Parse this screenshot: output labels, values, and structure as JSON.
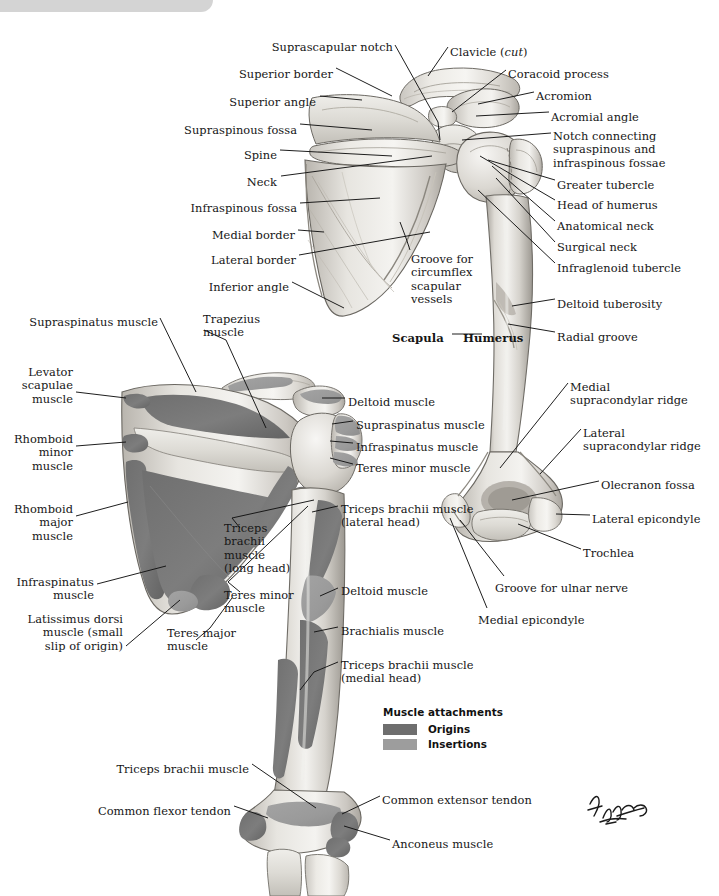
{
  "header": {
    "text": "SEE ALSO PLATE 400"
  },
  "plate": {
    "title": "Muscles of Shoulder and Arm: Bone and Muscle Attachments (Posterior View)"
  },
  "legend": {
    "title": "Muscle attachments",
    "items": [
      {
        "label": "Origins",
        "color": "#6e6e6e"
      },
      {
        "label": "Insertions",
        "color": "#9d9d9d"
      }
    ]
  },
  "bone_labels": [
    {
      "id": "suprascapular-notch",
      "text": "Suprascapular notch",
      "x": 393,
      "y": 41,
      "align": "right"
    },
    {
      "id": "clavicle-cut",
      "text": "Clavicle (cut)",
      "x": 450,
      "y": 46,
      "align": "left",
      "italic_part": "cut"
    },
    {
      "id": "superior-border",
      "text": "Superior border",
      "x": 333,
      "y": 68,
      "align": "right"
    },
    {
      "id": "coracoid-process",
      "text": "Coracoid process",
      "x": 508,
      "y": 68,
      "align": "left"
    },
    {
      "id": "superior-angle",
      "text": "Superior angle",
      "x": 316,
      "y": 96,
      "align": "right"
    },
    {
      "id": "acromion",
      "text": "Acromion",
      "x": 536,
      "y": 90,
      "align": "left"
    },
    {
      "id": "acromial-angle",
      "text": "Acromial angle",
      "x": 551,
      "y": 111,
      "align": "left"
    },
    {
      "id": "supraspinous-fossa",
      "text": "Supraspinous fossa",
      "x": 297,
      "y": 124,
      "align": "right"
    },
    {
      "id": "notch-connecting",
      "text": "Notch connecting\nsupraspinous and\ninfraspinous fossae",
      "x": 553,
      "y": 130,
      "align": "left"
    },
    {
      "id": "spine",
      "text": "Spine",
      "x": 277,
      "y": 149,
      "align": "right"
    },
    {
      "id": "greater-tubercle",
      "text": "Greater tubercle",
      "x": 557,
      "y": 179,
      "align": "left"
    },
    {
      "id": "neck",
      "text": "Neck",
      "x": 277,
      "y": 176,
      "align": "right"
    },
    {
      "id": "head-of-humerus",
      "text": "Head of humerus",
      "x": 557,
      "y": 199,
      "align": "left"
    },
    {
      "id": "infraspinous-fossa",
      "text": "Infraspinous fossa",
      "x": 297,
      "y": 202,
      "align": "right"
    },
    {
      "id": "anatomical-neck",
      "text": "Anatomical neck",
      "x": 557,
      "y": 220,
      "align": "left"
    },
    {
      "id": "medial-border",
      "text": "Medial border",
      "x": 295,
      "y": 229,
      "align": "right"
    },
    {
      "id": "surgical-neck",
      "text": "Surgical neck",
      "x": 557,
      "y": 241,
      "align": "left"
    },
    {
      "id": "lateral-border",
      "text": "Lateral border",
      "x": 296,
      "y": 254,
      "align": "right"
    },
    {
      "id": "infraglenoid-tubercle",
      "text": "Infraglenoid tubercle",
      "x": 557,
      "y": 262,
      "align": "left"
    },
    {
      "id": "inferior-angle",
      "text": "Inferior angle",
      "x": 289,
      "y": 281,
      "align": "right"
    },
    {
      "id": "groove-circumflex",
      "text": "Groove for\ncircumflex\nscapular\nvessels",
      "x": 411,
      "y": 253,
      "align": "left"
    },
    {
      "id": "deltoid-tuberosity",
      "text": "Deltoid tuberosity",
      "x": 557,
      "y": 298,
      "align": "left"
    },
    {
      "id": "scapula",
      "text": "Scapula",
      "x": 392,
      "y": 332,
      "align": "left",
      "bold": true
    },
    {
      "id": "humerus",
      "text": "Humerus",
      "x": 463,
      "y": 332,
      "align": "left",
      "bold": true
    },
    {
      "id": "radial-groove",
      "text": "Radial groove",
      "x": 557,
      "y": 331,
      "align": "left"
    },
    {
      "id": "medial-supracondylar",
      "text": "Medial\nsupracondylar ridge",
      "x": 570,
      "y": 381,
      "align": "left"
    },
    {
      "id": "lateral-supracondylar",
      "text": "Lateral\nsupracondylar ridge",
      "x": 583,
      "y": 427,
      "align": "left"
    },
    {
      "id": "olecranon-fossa",
      "text": "Olecranon fossa",
      "x": 601,
      "y": 479,
      "align": "left"
    },
    {
      "id": "lateral-epicondyle",
      "text": "Lateral epicondyle",
      "x": 592,
      "y": 513,
      "align": "left"
    },
    {
      "id": "trochlea",
      "text": "Trochlea",
      "x": 583,
      "y": 547,
      "align": "left"
    },
    {
      "id": "groove-ulnar-nerve",
      "text": "Groove for ulnar nerve",
      "x": 495,
      "y": 582,
      "align": "left"
    },
    {
      "id": "medial-epicondyle",
      "text": "Medial epicondyle",
      "x": 478,
      "y": 614,
      "align": "left"
    }
  ],
  "muscle_labels": [
    {
      "id": "supraspinatus-muscle-left",
      "text": "Supraspinatus muscle",
      "x": 158,
      "y": 316,
      "align": "right"
    },
    {
      "id": "trapezius-muscle",
      "text": "Trapezius\nmuscle",
      "x": 203,
      "y": 313,
      "align": "left"
    },
    {
      "id": "levator-scapulae-muscle",
      "text": "Levator\nscapulae\nmuscle",
      "x": 73,
      "y": 366,
      "align": "right"
    },
    {
      "id": "deltoid-muscle-top",
      "text": "Deltoid muscle",
      "x": 348,
      "y": 396,
      "align": "left"
    },
    {
      "id": "supraspinatus-muscle-right",
      "text": "Supraspinatus muscle",
      "x": 356,
      "y": 419,
      "align": "left"
    },
    {
      "id": "rhomboid-minor-muscle",
      "text": "Rhomboid\nminor\nmuscle",
      "x": 73,
      "y": 433,
      "align": "right"
    },
    {
      "id": "infraspinatus-muscle-right",
      "text": "Infraspinatus muscle",
      "x": 356,
      "y": 441,
      "align": "left"
    },
    {
      "id": "teres-minor-muscle-right",
      "text": "Teres minor muscle",
      "x": 356,
      "y": 462,
      "align": "left"
    },
    {
      "id": "rhomboid-major-muscle",
      "text": "Rhomboid\nmajor\nmuscle",
      "x": 73,
      "y": 503,
      "align": "right"
    },
    {
      "id": "triceps-lateral-head",
      "text": "Triceps brachii muscle\n(lateral head)",
      "x": 341,
      "y": 503,
      "align": "left"
    },
    {
      "id": "triceps-long-head",
      "text": "Triceps\nbrachii\nmuscle\n(long head)",
      "x": 224,
      "y": 522,
      "align": "left"
    },
    {
      "id": "deltoid-muscle-lower",
      "text": "Deltoid muscle",
      "x": 341,
      "y": 585,
      "align": "left"
    },
    {
      "id": "infraspinatus-muscle-left",
      "text": "Infraspinatus\nmuscle",
      "x": 94,
      "y": 576,
      "align": "right"
    },
    {
      "id": "teres-minor-muscle-left",
      "text": "Teres minor\nmuscle",
      "x": 224,
      "y": 589,
      "align": "left"
    },
    {
      "id": "brachialis-muscle",
      "text": "Brachialis muscle",
      "x": 341,
      "y": 625,
      "align": "left"
    },
    {
      "id": "teres-major-muscle",
      "text": "Teres major\nmuscle",
      "x": 167,
      "y": 627,
      "align": "left"
    },
    {
      "id": "latissimus-dorsi-muscle",
      "text": "Latissimus dorsi\nmuscle (small\nslip of origin)",
      "x": 123,
      "y": 613,
      "align": "right"
    },
    {
      "id": "triceps-medial-head",
      "text": "Triceps brachii muscle\n(medial head)",
      "x": 341,
      "y": 659,
      "align": "left"
    },
    {
      "id": "triceps-brachii-muscle-bottom",
      "text": "Triceps brachii muscle",
      "x": 249,
      "y": 763,
      "align": "right"
    },
    {
      "id": "common-extensor-tendon",
      "text": "Common extensor tendon",
      "x": 382,
      "y": 794,
      "align": "left"
    },
    {
      "id": "common-flexor-tendon",
      "text": "Common flexor tendon",
      "x": 231,
      "y": 805,
      "align": "right"
    },
    {
      "id": "anconeus-muscle",
      "text": "Anconeus muscle",
      "x": 392,
      "y": 838,
      "align": "left"
    }
  ]
}
